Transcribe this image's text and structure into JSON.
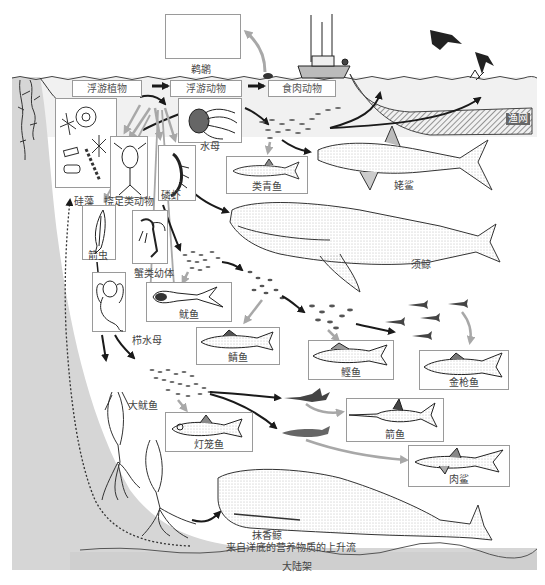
{
  "colors": {
    "shelf_gray": "#d6d6d6",
    "water_shade": "#e8e8e8",
    "arrow_black": "#1a1a1a",
    "arrow_gray": "#a8a8a8",
    "box_border": "#9a9a9a",
    "label_text": "#444444"
  },
  "trophic_levels": [
    {
      "id": "phytoplankton",
      "label": "浮游植物"
    },
    {
      "id": "zooplankton",
      "label": "浮游动物"
    },
    {
      "id": "carnivores",
      "label": "食肉动物"
    }
  ],
  "organisms": {
    "pelican": "鹈鹕",
    "diatoms": "硅藻",
    "jellyfish": "水母",
    "copepods": "挠足类动物",
    "krill": "磷虾",
    "arrow_worm": "箭虫",
    "crab_larvae": "蟹类幼体",
    "comb_jelly": "栉水母",
    "herring": "类青鱼",
    "basking_shark": "姥鲨",
    "humpback_whale": "须鲸",
    "squid": "鱿鱼",
    "mackerel": "鲭鱼",
    "bonito": "鲣鱼",
    "tuna": "金枪鱼",
    "giant_squid": "大鱿鱼",
    "lanternfish": "灯笼鱼",
    "swordfish": "箭鱼",
    "shark": "肉鲨",
    "sperm_whale": "抹香鲸",
    "fishing_net": "渔网"
  },
  "annotations": {
    "upwelling": "来自洋底的营养物质的上升流",
    "continental_shelf": "大陆架"
  },
  "icons": {
    "boat": "fishing-boat-icon",
    "bird": "seabird-icon",
    "seaweed": "kelp-icon"
  }
}
